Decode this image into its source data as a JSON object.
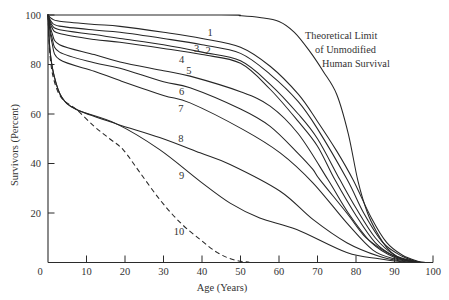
{
  "chart_data": {
    "type": "line",
    "title": "",
    "xlabel": "Age (Years)",
    "ylabel": "Survivors (Percent)",
    "xlim": [
      0,
      100
    ],
    "ylim": [
      0,
      100
    ],
    "grid": false,
    "legend": "inline curve labels",
    "xticks": [
      0,
      10,
      20,
      30,
      40,
      50,
      60,
      70,
      80,
      90,
      100
    ],
    "xtick_labels": [
      "0",
      "10",
      "20",
      "30",
      "40",
      "50",
      "60",
      "70",
      "80",
      "90",
      "100"
    ],
    "yticks": [
      20,
      40,
      60,
      80,
      100
    ],
    "ytick_labels": [
      "20",
      "40",
      "60",
      "80",
      "100"
    ],
    "annotation": {
      "lines": [
        "Theoretical Limit",
        "of Unmodified",
        "Human Survival"
      ]
    },
    "series": [
      {
        "name": "Theoretical Limit of Unmodified Human Survival",
        "label": "",
        "style": "solid",
        "points": [
          [
            0,
            100
          ],
          [
            45,
            100
          ],
          [
            50,
            99.7
          ],
          [
            55,
            99
          ],
          [
            60,
            97.4
          ],
          [
            64,
            93
          ],
          [
            68,
            85.3
          ],
          [
            71.5,
            77.2
          ],
          [
            75,
            67.9
          ],
          [
            78,
            52
          ],
          [
            80.5,
            33
          ],
          [
            83,
            20
          ],
          [
            85.5,
            12
          ],
          [
            88,
            6
          ],
          [
            90.6,
            2.4
          ],
          [
            94,
            0.4
          ],
          [
            97,
            0
          ]
        ]
      },
      {
        "name": "1",
        "label": "1",
        "style": "solid",
        "label_pos": [
          42.1,
          92.9
        ],
        "points": [
          [
            0,
            100
          ],
          [
            1,
            98.5
          ],
          [
            3,
            97.5
          ],
          [
            12,
            96.2
          ],
          [
            18.7,
            95.4
          ],
          [
            30,
            93
          ],
          [
            40,
            90.5
          ],
          [
            50,
            87
          ],
          [
            57.7,
            79.3
          ],
          [
            65,
            68
          ],
          [
            70,
            57
          ],
          [
            75,
            45
          ],
          [
            79.2,
            33.5
          ],
          [
            84,
            18
          ],
          [
            88,
            8
          ],
          [
            92,
            3
          ],
          [
            96,
            0.5
          ],
          [
            98,
            0
          ]
        ]
      },
      {
        "name": "2",
        "label": "2",
        "style": "solid",
        "label_pos": [
          41.6,
          85.7
        ],
        "points": [
          [
            0,
            100
          ],
          [
            1,
            97
          ],
          [
            3,
            95.5
          ],
          [
            12,
            93.9
          ],
          [
            18.7,
            93
          ],
          [
            30,
            90.5
          ],
          [
            40,
            88
          ],
          [
            50,
            84.5
          ],
          [
            57.7,
            76
          ],
          [
            65,
            65
          ],
          [
            70,
            54
          ],
          [
            77.7,
            33.5
          ],
          [
            82,
            20
          ],
          [
            87,
            8
          ],
          [
            92,
            2.5
          ],
          [
            96,
            0.3
          ],
          [
            98,
            0
          ]
        ]
      },
      {
        "name": "3",
        "label": "3",
        "style": "solid",
        "label_pos": [
          38.6,
          86.5
        ],
        "points": [
          [
            0,
            100
          ],
          [
            1,
            96
          ],
          [
            3,
            94
          ],
          [
            12,
            92.1
          ],
          [
            18.7,
            90.5
          ],
          [
            30,
            88
          ],
          [
            40,
            85
          ],
          [
            50,
            81.5
          ],
          [
            57.7,
            72
          ],
          [
            65,
            60
          ],
          [
            70,
            50
          ],
          [
            75.8,
            33.5
          ],
          [
            80,
            22
          ],
          [
            85,
            10
          ],
          [
            90,
            3
          ],
          [
            95,
            0.5
          ],
          [
            97,
            0
          ]
        ]
      },
      {
        "name": "4",
        "label": "4",
        "style": "solid",
        "label_pos": [
          34.7,
          82
        ],
        "points": [
          [
            0,
            100
          ],
          [
            1,
            95
          ],
          [
            3,
            92.5
          ],
          [
            12,
            90.1
          ],
          [
            18.7,
            89
          ],
          [
            30,
            86.5
          ],
          [
            40,
            84
          ],
          [
            50,
            80.5
          ],
          [
            57.7,
            70
          ],
          [
            65,
            57
          ],
          [
            70,
            47
          ],
          [
            74.5,
            33.5
          ],
          [
            80,
            19
          ],
          [
            85,
            8
          ],
          [
            90,
            2.5
          ],
          [
            95,
            0.3
          ],
          [
            97,
            0
          ]
        ]
      },
      {
        "name": "5",
        "label": "5",
        "style": "solid",
        "label_pos": [
          36.6,
          77.6
        ],
        "points": [
          [
            0,
            100
          ],
          [
            1,
            93
          ],
          [
            3,
            88
          ],
          [
            12,
            84
          ],
          [
            18.7,
            81
          ],
          [
            30,
            77.5
          ],
          [
            36.9,
            75.3
          ],
          [
            50,
            69
          ],
          [
            57.7,
            63.2
          ],
          [
            65,
            52
          ],
          [
            72.7,
            33.5
          ],
          [
            78,
            20
          ],
          [
            84,
            8
          ],
          [
            90,
            2
          ],
          [
            95,
            0.3
          ],
          [
            97,
            0
          ]
        ]
      },
      {
        "name": "6",
        "label": "6",
        "style": "solid",
        "label_pos": [
          34.7,
          69.1
        ],
        "points": [
          [
            0,
            100
          ],
          [
            1,
            91
          ],
          [
            3,
            85
          ],
          [
            12,
            80.7
          ],
          [
            18.7,
            78.5
          ],
          [
            30,
            73
          ],
          [
            36.9,
            70.6
          ],
          [
            50,
            62
          ],
          [
            57.7,
            55
          ],
          [
            65,
            44
          ],
          [
            68.8,
            37.6
          ],
          [
            70.6,
            33.5
          ],
          [
            77.6,
            20
          ],
          [
            82,
            11
          ],
          [
            86,
            6
          ],
          [
            90,
            2.5
          ],
          [
            95,
            0.3
          ],
          [
            97,
            0
          ]
        ]
      },
      {
        "name": "7",
        "label": "7",
        "style": "solid",
        "label_pos": [
          34.5,
          62.2
        ],
        "points": [
          [
            0,
            100
          ],
          [
            1,
            89
          ],
          [
            3,
            82
          ],
          [
            12,
            77.3
          ],
          [
            18.7,
            73.5
          ],
          [
            30,
            67.5
          ],
          [
            36.9,
            64.5
          ],
          [
            50.7,
            53.7
          ],
          [
            60.3,
            44.3
          ],
          [
            68.8,
            32.2
          ],
          [
            77.6,
            16
          ],
          [
            84.4,
            5
          ],
          [
            90,
            1.5
          ],
          [
            95,
            0.2
          ],
          [
            97,
            0
          ]
        ]
      },
      {
        "name": "8",
        "label": "8",
        "style": "solid",
        "label_pos": [
          34.5,
          50.1
        ],
        "points": [
          [
            0,
            100
          ],
          [
            0.5,
            86
          ],
          [
            1.5,
            76
          ],
          [
            3.5,
            67
          ],
          [
            7.4,
            61.8
          ],
          [
            17.8,
            56
          ],
          [
            29,
            50.5
          ],
          [
            39.5,
            44.3
          ],
          [
            47.3,
            39.6
          ],
          [
            60.3,
            28.8
          ],
          [
            68.8,
            17.4
          ],
          [
            77.6,
            8
          ],
          [
            86,
            2.5
          ],
          [
            92,
            0.5
          ],
          [
            96,
            0
          ]
        ]
      },
      {
        "name": "9",
        "label": "9",
        "style": "solid",
        "label_pos": [
          34.7,
          35.2
        ],
        "points": [
          [
            0,
            100
          ],
          [
            0.5,
            86
          ],
          [
            1.5,
            76
          ],
          [
            3.5,
            67
          ],
          [
            7.4,
            61.8
          ],
          [
            17.8,
            56
          ],
          [
            29,
            45.6
          ],
          [
            39.5,
            32.8
          ],
          [
            47.3,
            24
          ],
          [
            55,
            18
          ],
          [
            64.6,
            13.3
          ],
          [
            77.6,
            4
          ],
          [
            86,
            1.5
          ],
          [
            92,
            0.3
          ],
          [
            96,
            0
          ]
        ]
      },
      {
        "name": "10",
        "label": "10",
        "style": "dashed",
        "label_pos": [
          34,
          12.6
        ],
        "points": [
          [
            0,
            100
          ],
          [
            0.5,
            84
          ],
          [
            1.5,
            74
          ],
          [
            3.5,
            66.5
          ],
          [
            7.4,
            61.8
          ],
          [
            12,
            55
          ],
          [
            16,
            50
          ],
          [
            19.5,
            45.6
          ],
          [
            23.9,
            36.3
          ],
          [
            29,
            25.5
          ],
          [
            34.3,
            16.2
          ],
          [
            39.5,
            9.3
          ],
          [
            44,
            4
          ],
          [
            48,
            1.2
          ],
          [
            52,
            0.2
          ],
          [
            56,
            0
          ],
          [
            95,
            0
          ]
        ]
      }
    ]
  }
}
